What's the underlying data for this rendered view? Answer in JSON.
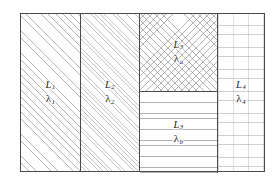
{
  "figure": {
    "type": "slab-cross-section-diagram",
    "frame": {
      "border_color": "#4a4a4a",
      "background": "#ffffff"
    }
  },
  "regions": [
    {
      "id": "region-l1",
      "name": "layer-1",
      "symbol": "L",
      "symbol_sub": "1",
      "lambda_glyph": "λ",
      "lambda_sub": "1",
      "fill": "diagonal-hatch-coarse",
      "fill_class": "fill-diag-coarse"
    },
    {
      "id": "region-l2",
      "name": "layer-2",
      "symbol": "L",
      "symbol_sub": "2",
      "lambda_glyph": "λ",
      "lambda_sub": "2",
      "fill": "diagonal-hatch-fine",
      "fill_class": "fill-diag-fine"
    },
    {
      "id": "region-l3a",
      "name": "layer-3-upper",
      "symbol": "L",
      "symbol_sub": "3",
      "lambda_glyph": "λ",
      "lambda_sub": "a",
      "fill": "cross-hatch",
      "fill_class": "fill-crosshatch"
    },
    {
      "id": "region-l3b",
      "name": "layer-3-lower",
      "symbol": "L",
      "symbol_sub": "3",
      "lambda_glyph": "λ",
      "lambda_sub": "b",
      "fill": "horizontal-lines",
      "fill_class": "fill-horizontal"
    },
    {
      "id": "region-l4",
      "name": "layer-4",
      "symbol": "L",
      "symbol_sub": "4",
      "lambda_glyph": "λ",
      "lambda_sub": "4",
      "fill": "brick-stipple",
      "fill_class": "fill-brick"
    }
  ],
  "labels": {
    "l1": {
      "top": "L",
      "top_sub": "1",
      "bottom": "λ",
      "bottom_sub": "1"
    },
    "l2": {
      "top": "L",
      "top_sub": "2",
      "bottom": "λ",
      "bottom_sub": "2"
    },
    "l3a": {
      "top": "L",
      "top_sub": "3",
      "bottom": "λ",
      "bottom_sub": "a"
    },
    "l3b": {
      "top": "L",
      "top_sub": "3",
      "bottom": "λ",
      "bottom_sub": "b"
    },
    "l4": {
      "top": "L",
      "top_sub": "4",
      "bottom": "λ",
      "bottom_sub": "4"
    }
  }
}
